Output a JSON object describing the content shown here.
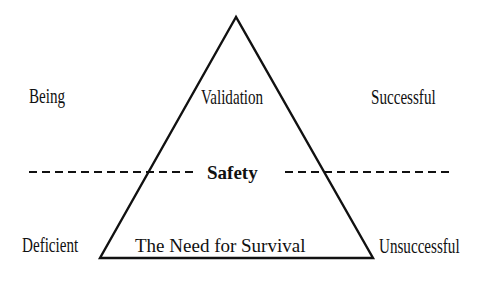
{
  "diagram": {
    "type": "pyramid",
    "colors": {
      "background": "#ffffff",
      "ink": "#111111"
    },
    "apex_label": "Validation",
    "divider_label": "Safety",
    "base_label": "The Need for Survival",
    "left_axis": {
      "top": "Being",
      "bottom": "Deficient"
    },
    "right_axis": {
      "top": "Successful",
      "bottom": "Unsuccessful"
    }
  }
}
